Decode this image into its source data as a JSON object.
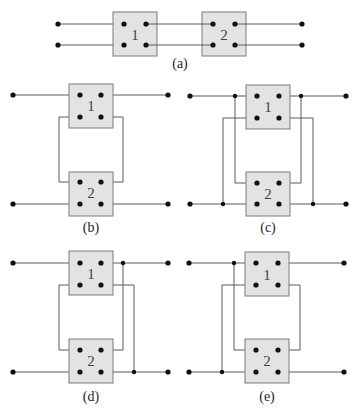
{
  "figure": {
    "colors": {
      "wire": "#5a5a5a",
      "box_fill": "#e3e3e3",
      "box_stroke": "#7a7a7a",
      "terminal": "#111111"
    },
    "panels": [
      {
        "id": "a",
        "caption": "(a)",
        "description": "Two-port networks 1 and 2 in cascade (series chain)"
      },
      {
        "id": "b",
        "caption": "(b)",
        "description": "Network 1 output ports looped to network 2 upper ports"
      },
      {
        "id": "c",
        "caption": "(c)",
        "description": "Parallel-type connection with junctions on both sides"
      },
      {
        "id": "d",
        "caption": "(d)",
        "description": "Junctions on right side only"
      },
      {
        "id": "e",
        "caption": "(e)",
        "description": "Junctions on left side only"
      }
    ],
    "network_labels": {
      "one": "1",
      "two": "2"
    }
  }
}
